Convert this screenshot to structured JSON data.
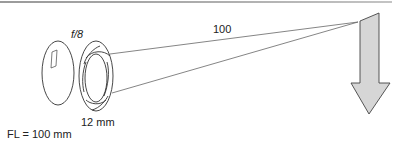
{
  "diagram": {
    "aperture_label": "f/8",
    "distance_label": "100",
    "aperture_diameter_label": "12 mm",
    "focal_length_label": "FL = 100 mm"
  },
  "colors": {
    "stroke": "#333333",
    "arrow_fill": "#d6d6d6",
    "ray": "#666666"
  }
}
